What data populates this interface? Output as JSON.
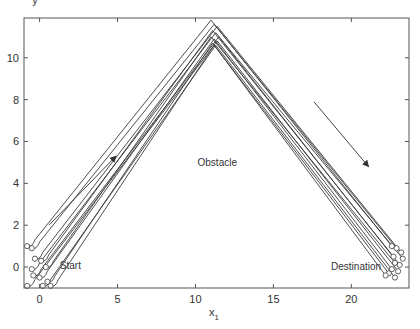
{
  "top_fragment": "y",
  "chart_data": {
    "type": "line",
    "title": "",
    "xlabel": "x",
    "xlabel_subscript": "1",
    "ylabel": "",
    "xlim": [
      -1.0,
      23.7
    ],
    "ylim": [
      -1.0,
      11.9
    ],
    "xticks": [
      0,
      5,
      10,
      15,
      20
    ],
    "xtick_labels": [
      "0",
      "5",
      "10",
      "15",
      "20"
    ],
    "yticks": [
      0,
      2,
      4,
      6,
      8,
      10
    ],
    "ytick_labels": [
      "0",
      "2",
      "4",
      "6",
      "8",
      "10"
    ],
    "grid": false,
    "legend": null,
    "annotations": [
      {
        "text": "Start",
        "x": 1.3,
        "y": -0.1
      },
      {
        "text": "Obstacle",
        "x": 11.4,
        "y": 4.85
      },
      {
        "text": "Destination",
        "x": 18.7,
        "y": -0.15
      }
    ],
    "arrows": [
      {
        "from": [
          0.6,
          2.0
        ],
        "to": [
          4.9,
          5.3
        ],
        "label": "direction up"
      },
      {
        "from": [
          17.6,
          7.9
        ],
        "to": [
          21.1,
          4.8
        ],
        "label": "direction down"
      }
    ],
    "series_description": "Multiple trajectories (about 12) from start points near (0,0) to destination points near (23,0), each forming an inverted V around an obstacle with apex near x≈11.2, y≈10.6–11.8",
    "series": [
      {
        "name": "traj1",
        "start": [
          -0.8,
          1.0
        ],
        "apex": [
          11.0,
          11.8
        ],
        "end": [
          22.6,
          1.0
        ]
      },
      {
        "name": "traj2",
        "start": [
          -0.5,
          0.9
        ],
        "apex": [
          11.2,
          11.6
        ],
        "end": [
          22.9,
          0.9
        ]
      },
      {
        "name": "traj3",
        "start": [
          -0.3,
          0.4
        ],
        "apex": [
          11.4,
          11.5
        ],
        "end": [
          23.2,
          0.7
        ]
      },
      {
        "name": "traj4",
        "start": [
          0.1,
          0.3
        ],
        "apex": [
          11.1,
          11.3
        ],
        "end": [
          22.7,
          0.5
        ]
      },
      {
        "name": "traj5",
        "start": [
          -0.5,
          -0.1
        ],
        "apex": [
          11.3,
          11.2
        ],
        "end": [
          23.3,
          0.4
        ]
      },
      {
        "name": "traj6",
        "start": [
          0.4,
          0.0
        ],
        "apex": [
          11.0,
          11.0
        ],
        "end": [
          22.8,
          0.2
        ]
      },
      {
        "name": "traj7",
        "start": [
          -0.4,
          -0.4
        ],
        "apex": [
          11.5,
          11.0
        ],
        "end": [
          23.1,
          0.1
        ]
      },
      {
        "name": "traj8",
        "start": [
          0.0,
          -0.5
        ],
        "apex": [
          11.2,
          10.9
        ],
        "end": [
          22.6,
          -0.1
        ]
      },
      {
        "name": "traj9",
        "start": [
          -0.8,
          -0.9
        ],
        "apex": [
          11.4,
          10.8
        ],
        "end": [
          23.0,
          -0.2
        ]
      },
      {
        "name": "traj10",
        "start": [
          0.5,
          -0.7
        ],
        "apex": [
          11.1,
          10.7
        ],
        "end": [
          22.4,
          -0.3
        ]
      },
      {
        "name": "traj11",
        "start": [
          0.2,
          -0.9
        ],
        "apex": [
          11.3,
          10.6
        ],
        "end": [
          22.8,
          -0.5
        ]
      },
      {
        "name": "traj12",
        "start": [
          0.7,
          -0.9
        ],
        "apex": [
          11.2,
          10.6
        ],
        "end": [
          22.2,
          -0.4
        ]
      }
    ]
  },
  "colors": {
    "line": "#3a3a3a",
    "axis": "#555555",
    "text": "#333333",
    "background": "#ffffff"
  }
}
